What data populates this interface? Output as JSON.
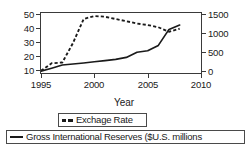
{
  "chart_data": {
    "type": "line",
    "title": "",
    "subtitle": "",
    "xlabel": "Year",
    "ylabel": "",
    "y2label": "",
    "xlim": [
      1995,
      2010
    ],
    "ylim": [
      10,
      50
    ],
    "y2lim": [
      0,
      1500
    ],
    "grid": false,
    "legend_position": "bottom",
    "xticks": [
      "1995",
      "2000",
      "2005",
      "2010"
    ],
    "xtick_values": [
      1995,
      2000,
      2005,
      2010
    ],
    "yticks_left": [
      "10",
      "20",
      "30",
      "40",
      "50"
    ],
    "ytick_left_values": [
      10,
      20,
      30,
      40,
      50
    ],
    "yticks_right": [
      "0",
      "500",
      "1000",
      "1500"
    ],
    "ytick_right_values": [
      0,
      500,
      1000,
      1500
    ],
    "series": [
      {
        "name": "Exchage Rate",
        "axis": "left",
        "style": "dashed",
        "color": "#1a1a1a",
        "x": [
          1995,
          1996,
          1997,
          1998,
          1999,
          2000,
          2001,
          2002,
          2003,
          2004,
          2005,
          2006,
          2007,
          2008
        ],
        "values": [
          11.5,
          16.5,
          17.0,
          30.0,
          46.0,
          48.0,
          47.5,
          46.0,
          44.5,
          43.0,
          42.0,
          40.5,
          37.5,
          39.5
        ]
      },
      {
        "name": "Gross International Reserves ($U.S. millions",
        "axis": "right",
        "style": "solid",
        "color": "#1a1a1a",
        "x": [
          1995,
          1996,
          1997,
          1998,
          1999,
          2000,
          2001,
          2002,
          2003,
          2004,
          2005,
          2006,
          2007,
          2008
        ],
        "values": [
          45,
          120,
          200,
          225,
          250,
          280,
          310,
          340,
          390,
          520,
          555,
          690,
          1090,
          1200
        ],
        "values_left_scale": [
          11.2,
          14.5,
          16.0,
          16.6,
          17.3,
          18.0,
          18.7,
          19.5,
          20.8,
          24.2,
          25.0,
          28.5,
          39.0,
          42.0
        ]
      }
    ]
  },
  "axis_title": {
    "year": "Year"
  },
  "legend": {
    "exchange_rate": "Exchage Rate",
    "reserves": "Gross International Reserves ($U.S. millions"
  },
  "colors": {
    "line": "#1a1a1a",
    "frame": "#3a3a3a",
    "background": "#ffffff"
  }
}
